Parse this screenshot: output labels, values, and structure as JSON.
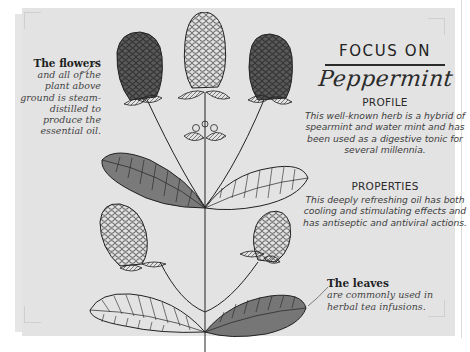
{
  "flowers_note": {
    "title": "The flowers",
    "body": "and all of the plant above ground is steam-distilled to produce the essential oil."
  },
  "leaves_note": {
    "title": "The leaves",
    "body": "are commonly used in herbal tea infusions."
  },
  "header": {
    "kicker": "FOCUS ON",
    "title": "Peppermint"
  },
  "profile": {
    "heading": "PROFILE",
    "body": "This well-known herb is a hybrid of spearmint and water mint and has been used as a digestive tonic for several millennia."
  },
  "properties": {
    "heading": "PROPERTIES",
    "body": "This deeply refreshing oil has both cooling and stimulating effects and has antiseptic and antiviral actions."
  },
  "illustration": {
    "subject": "peppermint-plant-drawing"
  },
  "colors": {
    "card": "#e3e3e3",
    "ink": "#2a2a2a",
    "shade": "#6a6a6a",
    "page": "#ffffff"
  }
}
